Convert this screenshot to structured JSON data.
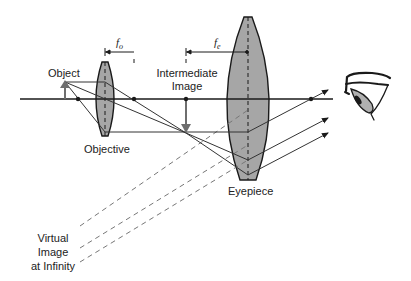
{
  "diagram": {
    "labels": {
      "object": "Object",
      "objective": "Objective",
      "intermediate_image_line1": "Intermediate",
      "intermediate_image_line2": "Image",
      "eyepiece": "Eyepiece",
      "virtual_line1": "Virtual",
      "virtual_line2": "Image",
      "virtual_line3": "at Infinity",
      "fo_main": "f",
      "fo_sub": "o",
      "fe_main": "f",
      "fe_sub": "e"
    },
    "colors": {
      "line": "#1a1a1a",
      "lens_fill": "#a6a6a6",
      "dashed": "#777777",
      "arrow_gray": "#6e6e6e",
      "eye_fill": "#b0b0b0"
    },
    "elements": [
      "optical-axis",
      "objective-lens",
      "eyepiece-lens",
      "object-arrow",
      "intermediate-image-arrow",
      "focal-points",
      "light-rays",
      "virtual-rays",
      "eye"
    ]
  }
}
